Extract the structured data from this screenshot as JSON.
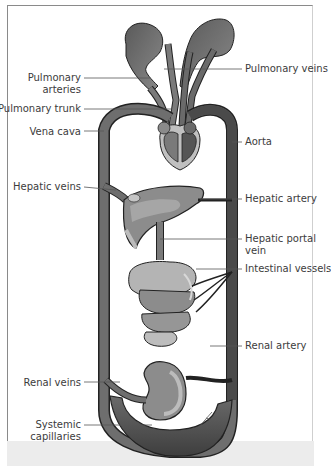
{
  "figure": {
    "labels_left": [
      {
        "id": "pulmonary-arteries",
        "line1": "Pulmonary",
        "line2": "arteries"
      },
      {
        "id": "pulmonary-trunk",
        "line1": "Pulmonary trunk"
      },
      {
        "id": "vena-cava",
        "line1": "Vena cava"
      },
      {
        "id": "hepatic-veins",
        "line1": "Hepatic veins"
      },
      {
        "id": "renal-veins",
        "line1": "Renal veins"
      },
      {
        "id": "systemic-capillaries",
        "line1": "Systemic",
        "line2": "capillaries"
      }
    ],
    "labels_right": [
      {
        "id": "pulmonary-veins",
        "line1": "Pulmonary veins"
      },
      {
        "id": "aorta",
        "line1": "Aorta"
      },
      {
        "id": "hepatic-artery",
        "line1": "Hepatic artery"
      },
      {
        "id": "hepatic-portal-vein",
        "line1": "Hepatic portal",
        "line2": "vein"
      },
      {
        "id": "intestinal-vessels",
        "line1": "Intestinal vessels"
      },
      {
        "id": "renal-artery",
        "line1": "Renal artery"
      }
    ],
    "colors": {
      "vessel_dark": "#4a4a4a",
      "vessel_mid": "#6e6e6e",
      "organ_mid": "#8c8c8c",
      "organ_light": "#b8b8b8",
      "leader_line": "#555555",
      "text": "#3c3c3c"
    }
  }
}
